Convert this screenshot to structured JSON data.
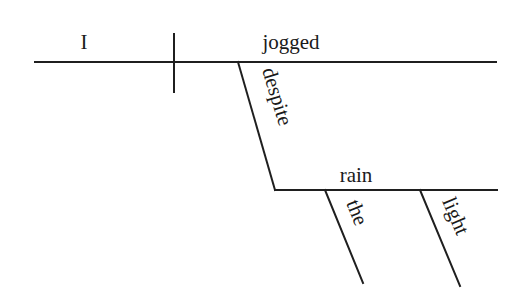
{
  "diagram": {
    "type": "sentence-diagram",
    "sentence": "I jogged despite the light rain",
    "subject": "I",
    "verb": "jogged",
    "preposition": "despite",
    "object_of_preposition": "rain",
    "modifiers": [
      "the",
      "light"
    ],
    "colors": {
      "line": "#1f1f1f",
      "text": "#1a1a1a",
      "background": "#ffffff"
    }
  }
}
